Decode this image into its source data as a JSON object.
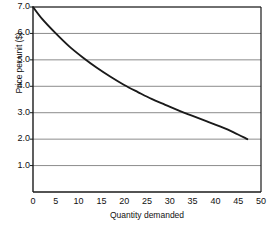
{
  "chart_data": {
    "type": "line",
    "title": "",
    "xlabel": "Quantity demanded",
    "ylabel": "Price per unit ($)",
    "xlim": [
      0,
      50
    ],
    "ylim": [
      0,
      7
    ],
    "xticks": [
      0,
      5,
      10,
      15,
      20,
      25,
      30,
      35,
      40,
      45,
      50
    ],
    "xtick_labels": [
      "0",
      "5",
      "10",
      "15",
      "20",
      "25",
      "30",
      "35",
      "40",
      "45",
      "50"
    ],
    "yticks": [
      1.0,
      2.0,
      3.0,
      4.0,
      5.0,
      6.0,
      7.0
    ],
    "ytick_labels": [
      "1.0",
      "2.0",
      "3.0",
      "4.0",
      "5.0",
      "6.0",
      "7.0"
    ],
    "grid": "horizontal",
    "legend": "none",
    "series": [
      {
        "name": "Demand curve",
        "color": "#1a1a1a",
        "x": [
          0,
          2,
          5,
          8,
          11,
          14,
          17,
          20,
          23,
          26,
          29,
          32,
          35,
          38,
          41,
          44,
          47
        ],
        "y": [
          7.0,
          6.55,
          6.0,
          5.5,
          5.08,
          4.7,
          4.36,
          4.05,
          3.78,
          3.52,
          3.3,
          3.08,
          2.88,
          2.68,
          2.48,
          2.26,
          2.0
        ]
      }
    ]
  },
  "axis": {
    "y_title": "Price per unit ($)",
    "x_title": "Quantity demanded"
  },
  "colors": {
    "curve": "#1a1a1a",
    "gridline": "#8c8c8c",
    "axis": "#1a1a1a",
    "background": "#ffffff"
  }
}
